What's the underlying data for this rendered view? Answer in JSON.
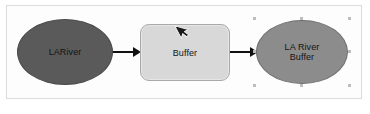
{
  "diagram": {
    "canvas_background": "#fdfdfd",
    "frame_border_color": "#dcdcdc",
    "nodes": [
      {
        "id": "input-ellipse",
        "role": "input-data",
        "shape": "ellipse",
        "label": "LARiver",
        "fill": "#5a5a5a",
        "stroke": "#4a4a4a",
        "selected": false
      },
      {
        "id": "tool-box",
        "role": "tool",
        "shape": "rounded-rectangle",
        "label": "Buffer",
        "fill": "#d8d8d8",
        "stroke": "#a9a9a9",
        "selected": false
      },
      {
        "id": "output-ellipse",
        "role": "derived-data",
        "shape": "ellipse",
        "label_line_1": "LA River",
        "label_line_2": "Buffer",
        "fill": "#8c8c8c",
        "stroke": "#6f6f6f",
        "selected": true
      }
    ],
    "connectors": [
      {
        "id": "connector-1",
        "from": "input-ellipse",
        "to": "tool-box",
        "color": "#111111",
        "arrowhead": "solid-triangle"
      },
      {
        "id": "connector-2",
        "from": "tool-box",
        "to": "output-ellipse",
        "color": "#111111",
        "arrowhead": "solid-triangle"
      }
    ],
    "cursor": {
      "icon": "mouse-pointer-icon",
      "fill": "#1a1a1a",
      "outline": "#ffffff"
    },
    "selection": {
      "handle_color": "#bdbdbd",
      "handle_count": 8
    }
  }
}
